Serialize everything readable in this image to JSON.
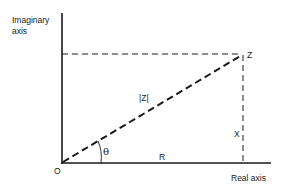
{
  "diagram": {
    "type": "complex-plane-polar-representation",
    "axes": {
      "vertical_label": "Imaginary axis",
      "horizontal_label": "Real axis",
      "origin_label": "O"
    },
    "point": {
      "label": "Z"
    },
    "segments": {
      "hypotenuse_label": "|Z|",
      "imaginary_component_label": "X",
      "real_component_label": "R"
    },
    "angle_label": "θ",
    "colors": {
      "ink": "#1a1a1a",
      "background": "#ffffff"
    }
  }
}
